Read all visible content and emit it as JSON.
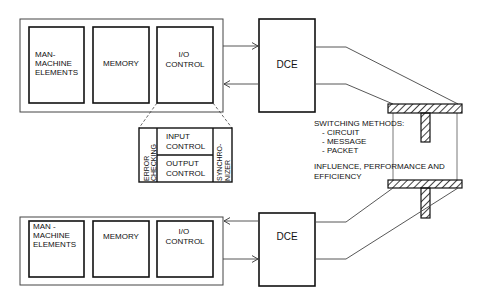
{
  "systems": [
    {
      "id": "top",
      "blocks": [
        "MAN-|MACHINE|ELEMENTS",
        "MEMORY",
        "I/O|CONTROL"
      ],
      "dce": "DCE"
    },
    {
      "id": "bottom",
      "blocks": [
        "MAN -|MACHINE|ELEMENTS",
        "MEMORY",
        "I/O|CONTROL"
      ],
      "dce": "DCE"
    }
  ],
  "io_detail": {
    "left": "ERROR|CHECKING",
    "input": "INPUT|CONTROL",
    "output": "OUTPUT|CONTROL",
    "right": "SYNCHRO-|NIZER"
  },
  "switching": {
    "title": "SWITCHING METHODS:",
    "items": [
      "- CIRCUIT",
      "- MESSAGE",
      "- PACKET"
    ]
  },
  "influence": {
    "line1": "INFLUENCE, PERFORMANCE  AND",
    "line2": "EFFICIENCY"
  },
  "colors": {
    "stroke": "#111111",
    "thin": "#444444",
    "background": "#ffffff"
  }
}
